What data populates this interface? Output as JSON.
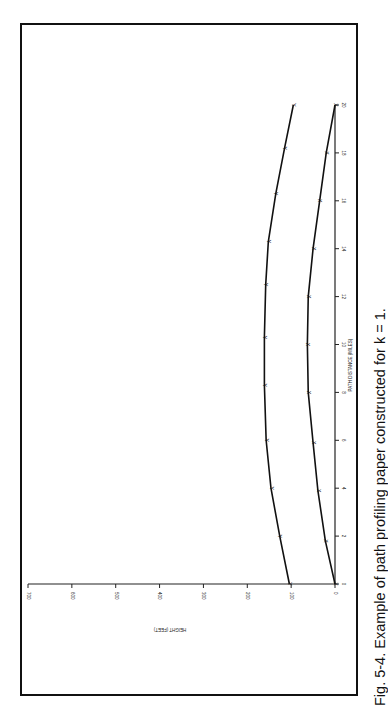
{
  "figure": {
    "caption": "Fig. 5-4. Example of path profiling paper constructed for k = 1."
  },
  "chart_data": {
    "type": "line",
    "title": "",
    "orientation": "rotated 90° counter-clockwise on page",
    "xlabel": "PATH DISTANCE (MILES)",
    "ylabel": "HEIGHT (FEET)",
    "xlim": [
      0,
      20
    ],
    "ylim": [
      0,
      700
    ],
    "x_ticks": [
      0,
      2,
      4,
      6,
      8,
      10,
      12,
      14,
      16,
      18,
      20
    ],
    "y_ticks": [
      0,
      100,
      200,
      300,
      400,
      500,
      600,
      700
    ],
    "grid": false,
    "legend": null,
    "series": [
      {
        "name": "Upper curve (Y markers)",
        "marker": "Y",
        "x": [
          0,
          2,
          4,
          6,
          8.3,
          10.3,
          12.5,
          14.3,
          16.3,
          18.2,
          20
        ],
        "values": [
          104,
          126,
          146,
          157,
          161,
          161,
          158,
          152,
          135,
          115,
          95
        ]
      },
      {
        "name": "Lower curve (X markers, k=1 earth bulge)",
        "marker": "X",
        "x": [
          0,
          1.8,
          3.9,
          5.9,
          8,
          10,
          12,
          14,
          16,
          18,
          20
        ],
        "values": [
          0,
          22,
          39,
          50,
          61,
          63,
          61,
          50,
          35,
          20,
          0
        ]
      }
    ]
  },
  "axes": {
    "height_title": "HEIGHT (FEET)",
    "distance_title": "PATH DISTANCE (MILES)",
    "height_labels": [
      "0",
      "100",
      "200",
      "300",
      "400",
      "500",
      "600",
      "700"
    ],
    "distance_labels": [
      "0",
      "2",
      "4",
      "6",
      "8",
      "10",
      "12",
      "14",
      "16",
      "18",
      "20"
    ]
  }
}
